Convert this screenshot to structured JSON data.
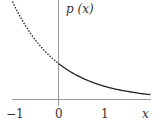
{
  "chart_data": {
    "type": "line",
    "title": "",
    "xlabel": "x",
    "ylabel": "p (x)",
    "xlim": [
      -1,
      2
    ],
    "ylim": [
      0,
      2.75
    ],
    "x_ticks": [
      -1,
      0,
      1
    ],
    "x_tick_labels": [
      "−1",
      "0",
      "1"
    ],
    "grid": false,
    "legend": null,
    "function": "p(x) = e^{-x}",
    "series": [
      {
        "name": "p(x) for x < 0",
        "style": "dotted",
        "x": [
          -1.0,
          -0.75,
          -0.5,
          -0.25,
          0.0
        ],
        "y": [
          2.72,
          2.12,
          1.65,
          1.28,
          1.0
        ]
      },
      {
        "name": "p(x) for x >= 0",
        "style": "solid",
        "x": [
          0.0,
          0.25,
          0.5,
          0.75,
          1.0,
          1.25,
          1.5,
          1.75,
          2.0
        ],
        "y": [
          1.0,
          0.78,
          0.61,
          0.47,
          0.37,
          0.29,
          0.22,
          0.17,
          0.14
        ]
      }
    ]
  },
  "labels": {
    "y_axis": "p (x)",
    "x_axis": "x",
    "tick_neg1": "−1",
    "tick_0": "0",
    "tick_1": "1"
  }
}
